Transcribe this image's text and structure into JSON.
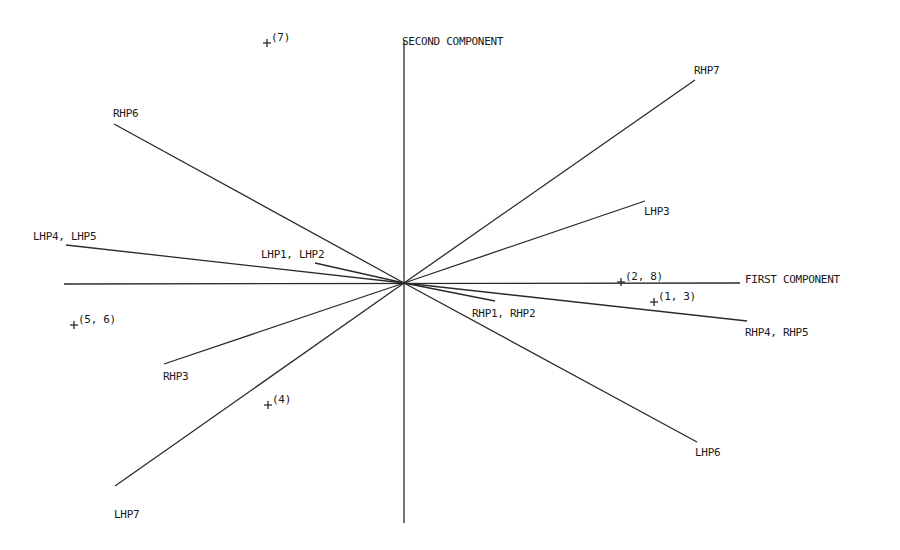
{
  "chart_data": {
    "type": "biplot",
    "title": "",
    "xlabel": "FIRST COMPONENT",
    "ylabel": "SECOND COMPONENT",
    "origin_px": [
      404,
      283
    ],
    "axes": {
      "horizontal": {
        "x1": 64,
        "y1": 284,
        "x2": 740,
        "y2": 283,
        "label": "FIRST COMPONENT",
        "label_x": 745,
        "label_y": 279
      },
      "vertical": {
        "x1": 404,
        "y1": 40,
        "x2": 404,
        "y2": 523,
        "label": "SECOND COMPONENT",
        "label_x": 402,
        "label_y": 41
      }
    },
    "vectors": [
      {
        "name": "RHP6",
        "end": [
          114,
          124
        ],
        "label_x": 113,
        "label_y": 117
      },
      {
        "name": "LHP4, LHP5",
        "end": [
          66,
          245
        ],
        "label_x": 33,
        "label_y": 240
      },
      {
        "name": "LHP1, LHP2",
        "end": [
          315,
          263
        ],
        "label_x": 261,
        "label_y": 258
      },
      {
        "name": "RHP7",
        "end": [
          695,
          80
        ],
        "label_x": 694,
        "label_y": 74
      },
      {
        "name": "LHP3",
        "end": [
          645,
          201
        ],
        "label_x": 644,
        "label_y": 215
      },
      {
        "name": "RHP1, RHP2",
        "end": [
          495,
          301
        ],
        "label_x": 472,
        "label_y": 317
      },
      {
        "name": "RHP4, RHP5",
        "end": [
          747,
          321
        ],
        "label_x": 745,
        "label_y": 336
      },
      {
        "name": "LHP6",
        "end": [
          697,
          442
        ],
        "label_x": 695,
        "label_y": 456
      },
      {
        "name": "RHP3",
        "end": [
          164,
          364
        ],
        "label_x": 163,
        "label_y": 380
      },
      {
        "name": "LHP7",
        "end": [
          115,
          486
        ],
        "label_x": 114,
        "label_y": 518
      }
    ],
    "points": [
      {
        "label": "(7)",
        "x": 267,
        "y": 43
      },
      {
        "label": "(2, 8)",
        "x": 621,
        "y": 282
      },
      {
        "label": "(1, 3)",
        "x": 654,
        "y": 302
      },
      {
        "label": "(5, 6)",
        "x": 74,
        "y": 325
      },
      {
        "label": "(4)",
        "x": 268,
        "y": 405
      }
    ],
    "grid": false,
    "legend": null
  }
}
